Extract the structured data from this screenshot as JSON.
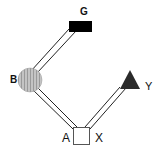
{
  "diagram": {
    "type": "pedigree-network",
    "nodes": [
      {
        "id": "G",
        "label": "G",
        "shape": "rectangle",
        "fill": "#000000"
      },
      {
        "id": "B",
        "label": "B",
        "shape": "circle",
        "fill": "#b8b8b8",
        "pattern": "vertical-stripes"
      },
      {
        "id": "Y",
        "label": "Y",
        "shape": "triangle",
        "fill": "#2a2a2a"
      },
      {
        "id": "AX",
        "label_left": "A",
        "label_right": "X",
        "shape": "square",
        "fill": "#ffffff"
      }
    ],
    "edges": [
      {
        "from": "G",
        "to": "B",
        "style": "double-line"
      },
      {
        "from": "B",
        "to": "AX",
        "style": "double-line"
      },
      {
        "from": "Y",
        "to": "AX",
        "style": "double-line"
      }
    ]
  },
  "labels": {
    "g": "G",
    "b": "B",
    "y": "Y",
    "a": "A",
    "x": "X"
  }
}
